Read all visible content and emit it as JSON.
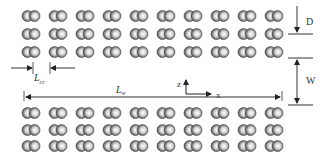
{
  "figure": {
    "top_block": {
      "rows": 3,
      "columns": 10,
      "row_y": [
        16,
        34,
        52
      ]
    },
    "bottom_block": {
      "rows": 3,
      "columns": 10,
      "row_y": [
        113,
        130,
        146
      ]
    },
    "column_x": [
      31,
      58,
      85,
      112,
      139,
      166,
      193,
      220,
      247,
      274
    ],
    "particle_color": "#8a8a8a",
    "line_color": "#333333"
  },
  "labels": {
    "D": "D",
    "W": "W",
    "L_cc_main": "L",
    "L_cc_sub": "cc",
    "L_long_main": "L",
    "L_long_sub": "w",
    "axis_z": "z",
    "axis_x": "x"
  }
}
